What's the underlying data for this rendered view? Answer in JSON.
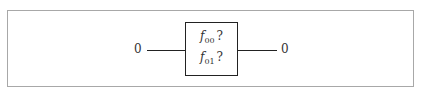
{
  "top_text": "",
  "diagram": {
    "input_label": "0",
    "output_label": "0",
    "box": {
      "lines": [
        {
          "symbol": "f",
          "subscript": "00",
          "suffix": "?"
        },
        {
          "symbol": "f",
          "subscript": "01",
          "suffix": "?"
        }
      ]
    }
  }
}
